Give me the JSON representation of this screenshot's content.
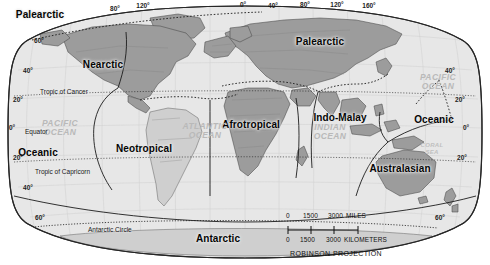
{
  "map": {
    "projection_label": "ROBINSON PROJECTION",
    "realms": [
      {
        "name": "Palearctic",
        "x": 40,
        "y": 14,
        "variant": "big"
      },
      {
        "name": "Nearctic",
        "x": 103,
        "y": 64,
        "variant": "big"
      },
      {
        "name": "Palearctic",
        "x": 320,
        "y": 41,
        "variant": "big"
      },
      {
        "name": "Indo-Malay",
        "x": 340,
        "y": 117,
        "variant": "big"
      },
      {
        "name": "Oceanic",
        "x": 38,
        "y": 152,
        "variant": "big"
      },
      {
        "name": "Oceanic",
        "x": 434,
        "y": 119,
        "variant": "big"
      },
      {
        "name": "Neotropical",
        "x": 144,
        "y": 148,
        "variant": "big"
      },
      {
        "name": "Afrotropical",
        "x": 251,
        "y": 124,
        "variant": "big"
      },
      {
        "name": "Australasian",
        "x": 400,
        "y": 168,
        "variant": "big"
      },
      {
        "name": "Antarctic",
        "x": 218,
        "y": 238,
        "variant": "big"
      }
    ],
    "oceans": [
      {
        "name": "PACIFIC\nOCEAN",
        "x": 60,
        "y": 128
      },
      {
        "name": "ATLANTIC\nOCEAN",
        "x": 205,
        "y": 131
      },
      {
        "name": "INDIAN\nOCEAN",
        "x": 330,
        "y": 132
      },
      {
        "name": "PACIFIC\nOCEAN",
        "x": 438,
        "y": 82
      }
    ],
    "seas": [
      {
        "name": "CORAL\nSEA",
        "x": 432,
        "y": 148
      }
    ],
    "reference_lines": [
      {
        "label": "Tropic of Cancer",
        "x": 40,
        "y": 88
      },
      {
        "label": "Equator",
        "x": 25,
        "y": 128
      },
      {
        "label": "Tropic of Capricorn",
        "x": 35,
        "y": 168
      },
      {
        "label": "Antarctic Circle",
        "x": 88,
        "y": 226
      }
    ],
    "longitude_ticks_top": [
      {
        "label": "80°",
        "x": 115,
        "y": 8
      },
      {
        "label": "120°",
        "x": 143,
        "y": 5
      },
      {
        "label": "0°",
        "x": 243,
        "y": 4
      },
      {
        "label": "40°",
        "x": 273,
        "y": 5
      },
      {
        "label": "80°",
        "x": 305,
        "y": 4
      },
      {
        "label": "120°",
        "x": 337,
        "y": 4
      },
      {
        "label": "160°",
        "x": 369,
        "y": 5
      }
    ],
    "latitude_ticks_left": [
      {
        "label": "60°",
        "x": 39,
        "y": 40
      },
      {
        "label": "40°",
        "x": 28,
        "y": 70
      },
      {
        "label": "20°",
        "x": 18,
        "y": 99
      },
      {
        "label": "0°",
        "x": 12,
        "y": 127
      },
      {
        "label": "20°",
        "x": 18,
        "y": 157
      },
      {
        "label": "40°",
        "x": 28,
        "y": 187
      },
      {
        "label": "60°",
        "x": 40,
        "y": 217
      }
    ],
    "latitude_ticks_right": [
      {
        "label": "40°",
        "x": 450,
        "y": 70
      },
      {
        "label": "20°",
        "x": 460,
        "y": 99
      },
      {
        "label": "0°",
        "x": 466,
        "y": 127
      },
      {
        "label": "20°",
        "x": 462,
        "y": 157
      },
      {
        "label": "60°",
        "x": 440,
        "y": 217
      }
    ],
    "scale": {
      "miles": {
        "ticks": [
          "0",
          "1500",
          "3000"
        ],
        "unit": "MILES"
      },
      "kilometers": {
        "ticks": [
          "0",
          "1500",
          "3000"
        ],
        "unit": "KILOMETERS"
      }
    },
    "colors": {
      "ocean_fill": "#e7e7e7",
      "land_dark": "#9c9c9c",
      "land_light": "#cfcfcf",
      "outline": "#2a2a2a",
      "background": "#ffffff"
    }
  }
}
